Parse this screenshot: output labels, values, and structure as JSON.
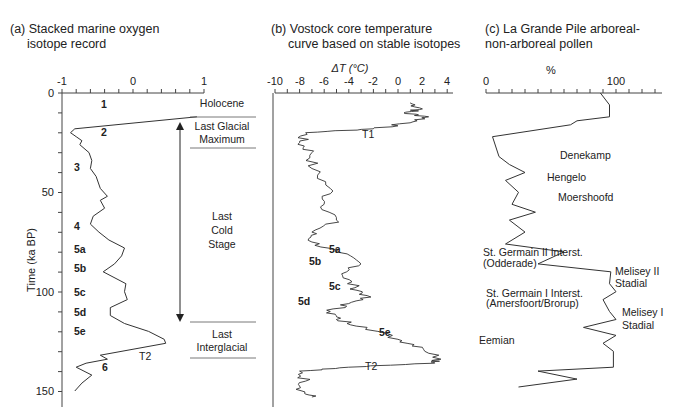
{
  "panels": {
    "a": {
      "title_line1": "(a) Stacked marine oxygen",
      "title_line2": "isotope record",
      "x_ticks": [
        "-1",
        "0",
        "1"
      ],
      "y_ticks": [
        "0",
        "50",
        "100",
        "150"
      ],
      "y_label": "Time (ka BP)",
      "stage_labels": [
        "1",
        "2",
        "3",
        "4",
        "5a",
        "5b",
        "5c",
        "5d",
        "5e",
        "6"
      ],
      "transition_label": "T2",
      "period_labels": {
        "holocene": "Holocene",
        "lgm_1": "Last Glacial",
        "lgm_2": "Maximum",
        "lcs_1": "Last",
        "lcs_2": "Cold",
        "lcs_3": "Stage",
        "li_1": "Last",
        "li_2": "Interglacial"
      }
    },
    "b": {
      "title_line1": "(b) Vostock core temperature",
      "title_line2": "curve based on stable isotopes",
      "x_label": "ΔT (°C)",
      "x_ticks": [
        "-10",
        "-8",
        "-6",
        "-4",
        "-2",
        "0",
        "2",
        "4"
      ],
      "stage_labels": [
        "5a",
        "5b",
        "5c",
        "5d",
        "5e"
      ],
      "transition_labels": [
        "T1",
        "T2"
      ]
    },
    "c": {
      "title_line1": "(c) La Grande Pile arboreal-",
      "title_line2": "non-arboreal pollen",
      "x_label": "%",
      "x_ticks": [
        "0",
        "100"
      ],
      "annotations": {
        "denekamp": "Denekamp",
        "hengelo": "Hengelo",
        "moershoofd": "Moershoofd",
        "sg2_1": "St. Germain II Interst.",
        "sg2_2": "(Odderade)",
        "m2_1": "Melisey II",
        "m2_2": "Stadial",
        "sg1_1": "St. Germain I Interst.",
        "sg1_2": "(Amersfoort/Brorup)",
        "m1_1": "Melisey I",
        "m1_2": "Stadial",
        "eemian": "Eemian"
      }
    }
  },
  "chart_data": [
    {
      "type": "line",
      "title": "(a) Stacked marine oxygen isotope record",
      "xlabel": "",
      "ylabel": "Time (ka BP)",
      "xlim": [
        -1,
        1
      ],
      "ylim": [
        0,
        150
      ],
      "y_inverted": true,
      "grid": false,
      "series": [
        {
          "name": "δ18O stack",
          "points": [
            [
              0.9,
              12
            ],
            [
              -0.82,
              18
            ],
            [
              -0.88,
              20
            ],
            [
              -0.8,
              22
            ],
            [
              -0.72,
              24
            ],
            [
              -0.75,
              26
            ],
            [
              -0.62,
              30
            ],
            [
              -0.58,
              34
            ],
            [
              -0.6,
              38
            ],
            [
              -0.52,
              42
            ],
            [
              -0.46,
              48
            ],
            [
              -0.36,
              52
            ],
            [
              -0.46,
              54
            ],
            [
              -0.4,
              58
            ],
            [
              -0.56,
              62
            ],
            [
              -0.6,
              66
            ],
            [
              -0.48,
              70
            ],
            [
              -0.34,
              74
            ],
            [
              -0.12,
              78
            ],
            [
              -0.16,
              82
            ],
            [
              -0.26,
              86
            ],
            [
              -0.42,
              90
            ],
            [
              -0.1,
              96
            ],
            [
              -0.12,
              100
            ],
            [
              -0.08,
              104
            ],
            [
              -0.32,
              108
            ],
            [
              -0.32,
              112
            ],
            [
              -0.12,
              116
            ],
            [
              0.22,
              120
            ],
            [
              0.44,
              124
            ],
            [
              0.46,
              126
            ],
            [
              -0.46,
              132
            ],
            [
              -0.36,
              134
            ],
            [
              -0.66,
              136
            ],
            [
              -0.8,
              138
            ],
            [
              -0.58,
              142
            ],
            [
              -0.72,
              146
            ],
            [
              -0.82,
              150
            ]
          ]
        }
      ],
      "annotations": [
        "1",
        "2",
        "3",
        "4",
        "5a",
        "5b",
        "5c",
        "5d",
        "5e",
        "6",
        "T2",
        "Holocene",
        "Last Glacial Maximum",
        "Last Cold Stage",
        "Last Interglacial"
      ]
    },
    {
      "type": "line",
      "title": "(b) Vostock core temperature curve based on stable isotopes",
      "xlabel": "ΔT (°C)",
      "ylabel": "Time (ka BP)",
      "xlim": [
        -10,
        4
      ],
      "ylim": [
        0,
        155
      ],
      "y_inverted": true,
      "grid": false,
      "series": [
        {
          "name": "ΔT",
          "points": [
            [
              1,
              5
            ],
            [
              2,
              8
            ],
            [
              0.5,
              10
            ],
            [
              2.5,
              12
            ],
            [
              1,
              15
            ],
            [
              -2,
              18
            ],
            [
              -7.5,
              20
            ],
            [
              -8,
              25
            ],
            [
              -7,
              30
            ],
            [
              -7,
              38
            ],
            [
              -5.5,
              48
            ],
            [
              -6,
              56
            ],
            [
              -5,
              64
            ],
            [
              -7,
              70
            ],
            [
              -7,
              75
            ],
            [
              -5,
              80
            ],
            [
              -3,
              86
            ],
            [
              -4.5,
              92
            ],
            [
              -3.5,
              98
            ],
            [
              -2.5,
              102
            ],
            [
              -4,
              106
            ],
            [
              -5.5,
              110
            ],
            [
              -5,
              114
            ],
            [
              -2.5,
              118
            ],
            [
              0,
              124
            ],
            [
              2,
              128
            ],
            [
              3.5,
              134
            ],
            [
              3,
              136
            ],
            [
              -4,
              138
            ],
            [
              -8,
              140
            ],
            [
              -7.5,
              145
            ],
            [
              -7.8,
              150
            ],
            [
              -7,
              153
            ]
          ]
        }
      ],
      "annotations": [
        "T1",
        "5a",
        "5b",
        "5c",
        "5d",
        "5e",
        "T2"
      ]
    },
    {
      "type": "line",
      "title": "(c) La Grande Pile arboreal-non-arboreal pollen",
      "xlabel": "%",
      "ylabel": "Time (ka BP)",
      "xlim": [
        0,
        130
      ],
      "ylim": [
        0,
        150
      ],
      "y_inverted": true,
      "grid": false,
      "series": [
        {
          "name": "Arboreal pollen %",
          "points": [
            [
              88,
              0
            ],
            [
              95,
              6
            ],
            [
              95,
              12
            ],
            [
              70,
              14
            ],
            [
              65,
              16
            ],
            [
              5,
              22
            ],
            [
              10,
              32
            ],
            [
              18,
              36
            ],
            [
              30,
              40
            ],
            [
              15,
              44
            ],
            [
              25,
              50
            ],
            [
              20,
              56
            ],
            [
              38,
              60
            ],
            [
              18,
              64
            ],
            [
              30,
              70
            ],
            [
              15,
              76
            ],
            [
              60,
              80
            ],
            [
              40,
              86
            ],
            [
              96,
              90
            ],
            [
              95,
              96
            ],
            [
              100,
              100
            ],
            [
              90,
              104
            ],
            [
              95,
              110
            ],
            [
              100,
              114
            ],
            [
              75,
              118
            ],
            [
              100,
              122
            ],
            [
              90,
              126
            ],
            [
              98,
              130
            ],
            [
              98,
              138
            ],
            [
              40,
              140
            ],
            [
              70,
              144
            ],
            [
              25,
              148
            ]
          ]
        }
      ],
      "annotations": [
        "Denekamp",
        "Hengelo",
        "Moershoofd",
        "St. Germain II Interst. (Odderade)",
        "Melisey II Stadial",
        "St. Germain I Interst. (Amersfoort/Brorup)",
        "Melisey I Stadial",
        "Eemian"
      ]
    }
  ]
}
